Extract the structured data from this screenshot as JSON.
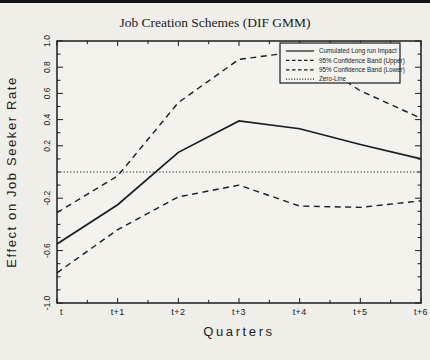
{
  "page": {
    "background": "#efeee9",
    "top_bar_color": "#141414",
    "plot_fill": "#f3f2ed",
    "line_color": "#1c1c1c"
  },
  "chart_data": {
    "type": "line",
    "title": "Job Creation Schemes (DIF GMM)",
    "xlabel": "Quarters",
    "ylabel": "Effect on Job Seeker Rate",
    "categories": [
      "t",
      "t+1",
      "t+2",
      "t+3",
      "t+4",
      "t+5",
      "t+6"
    ],
    "ylim": [
      -1.0,
      1.0
    ],
    "y_tick_values": [
      1.0,
      0.8,
      0.6,
      0.4,
      0.2,
      -0.2,
      -0.6,
      -1.0
    ],
    "y_tick_labels": [
      "1.0",
      "0.8",
      "0.6",
      "0.4",
      "0.2",
      "-0.2",
      "-0.6",
      "-1.0"
    ],
    "y_minor_step": 0.1,
    "grid": false,
    "legend_position": "top-right",
    "series": [
      {
        "name": "Cumulated Long run Impact",
        "style": "solid",
        "values": [
          -0.55,
          -0.25,
          0.15,
          0.39,
          0.33,
          0.21,
          0.1
        ]
      },
      {
        "name": "95% Confidence Band (Upper)",
        "style": "dashed",
        "values": [
          -0.31,
          -0.03,
          0.53,
          0.86,
          0.92,
          0.62,
          0.41
        ]
      },
      {
        "name": "95% Confidence Band (Lower)",
        "style": "dashed",
        "values": [
          -0.77,
          -0.44,
          -0.19,
          -0.1,
          -0.26,
          -0.27,
          -0.22
        ]
      },
      {
        "name": "Zero-Line",
        "style": "dotted",
        "values": [
          0,
          0,
          0,
          0,
          0,
          0,
          0
        ]
      }
    ]
  }
}
